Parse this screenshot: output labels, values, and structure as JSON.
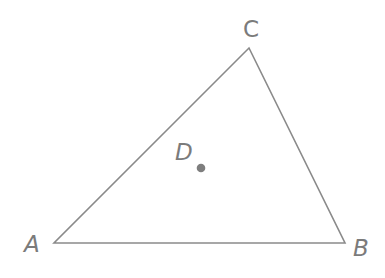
{
  "diagram": {
    "type": "geometry-triangle",
    "colors": {
      "line": "#8a8a8a",
      "label": "#7b7b7b",
      "point": "#7e7e7e",
      "background": "#ffffff"
    },
    "vertices": [
      {
        "id": "A",
        "label": "A",
        "x": 54,
        "y": 243
      },
      {
        "id": "B",
        "label": "B",
        "x": 345,
        "y": 243
      },
      {
        "id": "C",
        "label": "C",
        "x": 249,
        "y": 48
      }
    ],
    "points": [
      {
        "id": "D",
        "label": "D",
        "x": 201,
        "y": 168
      }
    ],
    "edges": [
      [
        "A",
        "B"
      ],
      [
        "B",
        "C"
      ],
      [
        "C",
        "A"
      ]
    ]
  }
}
